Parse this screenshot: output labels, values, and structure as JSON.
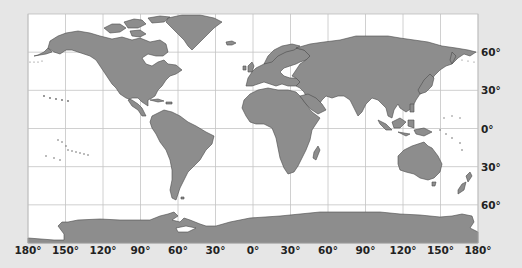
{
  "map": {
    "projection": "equirectangular",
    "ocean_color": "#ffffff",
    "land_color": "#8d8d8d",
    "coast_color": "#4a4a4a",
    "grid_color": "#bdbdbd",
    "background_color": "#e6e6e6",
    "frame": {
      "left": 28,
      "top": 14,
      "right": 478,
      "bottom": 243
    }
  },
  "x_axis": {
    "ticks": [
      {
        "lon": -180,
        "label": "180°"
      },
      {
        "lon": -150,
        "label": "150°"
      },
      {
        "lon": -120,
        "label": "120°"
      },
      {
        "lon": -90,
        "label": "90°"
      },
      {
        "lon": -60,
        "label": "60°"
      },
      {
        "lon": -30,
        "label": "30°"
      },
      {
        "lon": 0,
        "label": "0°"
      },
      {
        "lon": 30,
        "label": "30°"
      },
      {
        "lon": 60,
        "label": "60°"
      },
      {
        "lon": 90,
        "label": "90°"
      },
      {
        "lon": 120,
        "label": "120°"
      },
      {
        "lon": 150,
        "label": "150°"
      },
      {
        "lon": 180,
        "label": "180°"
      }
    ]
  },
  "y_axis": {
    "position": "right",
    "ticks": [
      {
        "lat": 60,
        "label": "60°"
      },
      {
        "lat": 30,
        "label": "30°"
      },
      {
        "lat": 0,
        "label": "0°"
      },
      {
        "lat": -30,
        "label": "30°"
      },
      {
        "lat": -60,
        "label": "60°"
      }
    ]
  }
}
